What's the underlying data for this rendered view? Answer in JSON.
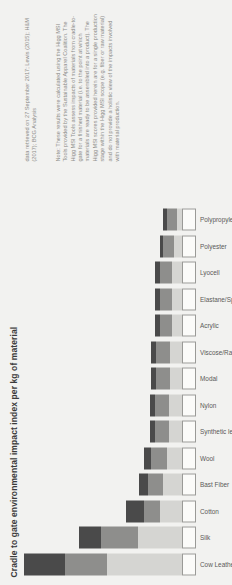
{
  "chart_data": {
    "type": "bar",
    "title": "Cradle to gate environmental impact index per kg of material",
    "xlabel": "",
    "ylabel": "",
    "ylim": [
      0,
      100
    ],
    "grid": false,
    "legend_position": "none",
    "stacked": true,
    "orientation": "vertical-rotated-90ccw",
    "categories": [
      "Cow Leather",
      "Silk",
      "Cotton",
      "Bast Fiber",
      "Wool",
      "Synthetic leather",
      "Nylon",
      "Modal",
      "Viscose/Rayon",
      "Acrylic",
      "Elastane/Spandex",
      "Lyocell",
      "Polyester",
      "Polypropylene"
    ],
    "series": [
      {
        "name": "segment-1",
        "color": "#fbfbf9",
        "values": [
          8,
          8,
          8,
          8,
          8,
          8,
          8,
          8,
          8,
          8,
          8,
          8,
          8,
          8
        ]
      },
      {
        "name": "segment-2",
        "color": "#d5d5d2",
        "values": [
          44,
          26,
          13,
          11,
          9,
          8,
          8,
          7,
          7,
          6,
          6,
          6,
          5,
          3
        ]
      },
      {
        "name": "segment-3",
        "color": "#8e8e8c",
        "values": [
          24,
          21,
          9,
          9,
          9,
          8,
          8,
          8,
          8,
          7,
          7,
          7,
          6,
          6
        ]
      },
      {
        "name": "segment-4",
        "color": "#4a4a4a",
        "values": [
          24,
          13,
          11,
          5,
          4,
          3,
          3,
          3,
          3,
          3,
          3,
          3,
          2,
          2
        ]
      }
    ],
    "totals": [
      100,
      68,
      41,
      33,
      30,
      27,
      27,
      26,
      26,
      24,
      24,
      24,
      21,
      19
    ]
  },
  "source": "data retrieved on 27 September 2017; Lewis (2015); H&M (2017); BCG Analysis",
  "note": "Note: These results were calculated using the Higg MSI Tools provided by the Sustainable Apparel Coalition. The Higg MSI Tools assess impacts of materials from cradle-to-gate for a finished material (i.e. to the point at which materials are ready to be assembled into a product). The Higg MSI scores provided herein are for a single production stage within the Higg MSI scope (e.g. fiber or raw material) and do not provide a holistic view of the impacts involved with material production.",
  "colors": {
    "background": "#f2f2f0",
    "segment_1": "#fbfbf9",
    "segment_2": "#d5d5d2",
    "segment_3": "#8e8e8c",
    "segment_4": "#4a4a4a",
    "title_text": "#3b3b3b",
    "label_text": "#5a5a58",
    "note_text": "#8d8d8a"
  }
}
